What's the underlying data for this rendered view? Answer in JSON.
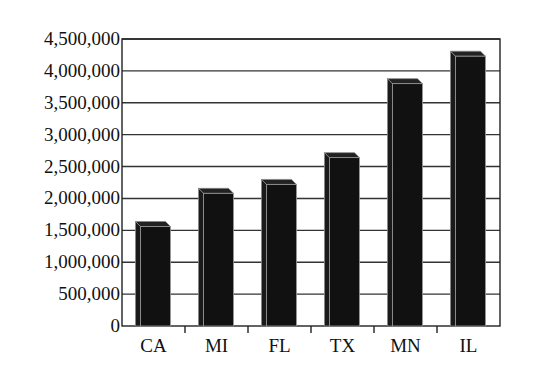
{
  "chart_data": {
    "type": "bar",
    "title": "",
    "xlabel": "",
    "ylabel": "",
    "categories": [
      "CA",
      "MI",
      "FL",
      "TX",
      "MN",
      "IL"
    ],
    "values": [
      1560000,
      2080000,
      2220000,
      2640000,
      3800000,
      4230000
    ],
    "ylim": [
      0,
      4500000
    ],
    "yticks": [
      0,
      500000,
      1000000,
      1500000,
      2000000,
      2500000,
      3000000,
      3500000,
      4000000,
      4500000
    ],
    "ytick_labels": [
      "0",
      "500,000",
      "1,000,000",
      "1,500,000",
      "2,000,000",
      "2,500,000",
      "3,000,000",
      "3,500,000",
      "4,000,000",
      "4,500,000"
    ],
    "grid": true,
    "legend": null,
    "style": "3d-bars",
    "bar_color": "#111111"
  }
}
